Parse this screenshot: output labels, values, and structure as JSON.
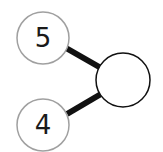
{
  "diagram": {
    "type": "number-bond",
    "parts": [
      {
        "label": "5",
        "cx": 43,
        "cy": 38,
        "r": 26
      },
      {
        "label": "4",
        "cx": 43,
        "cy": 125,
        "r": 26
      }
    ],
    "whole": {
      "label": "",
      "cx": 123,
      "cy": 80,
      "r": 27
    },
    "colors": {
      "part_stroke": "#a0a0a0",
      "whole_stroke": "#111111",
      "connector": "#111111",
      "text": "#1a1a1a"
    }
  }
}
